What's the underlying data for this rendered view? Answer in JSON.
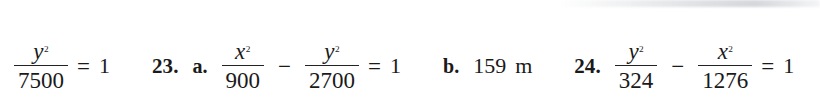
{
  "page": {
    "background_color": "#ffffff",
    "ink_color": "#1a1a1a"
  },
  "answers": [
    {
      "id": "answer-fragment-tail",
      "number": "",
      "parts": [
        {
          "kind": "fraction",
          "numerator_base": "y",
          "numerator_exponent": "2",
          "denominator": "7500"
        },
        {
          "kind": "operator",
          "text": "="
        },
        {
          "kind": "number",
          "text": "1"
        }
      ]
    },
    {
      "id": "answer-23",
      "number": "23.",
      "part_a_label": "a.",
      "part_b_label": "b.",
      "part_a": [
        {
          "kind": "fraction",
          "numerator_base": "x",
          "numerator_exponent": "2",
          "denominator": "900"
        },
        {
          "kind": "operator",
          "text": "−"
        },
        {
          "kind": "fraction",
          "numerator_base": "y",
          "numerator_exponent": "2",
          "denominator": "2700"
        },
        {
          "kind": "operator",
          "text": "="
        },
        {
          "kind": "number",
          "text": "1"
        }
      ],
      "part_b": {
        "value": "159",
        "unit": "m"
      }
    },
    {
      "id": "answer-24",
      "number": "24.",
      "parts": [
        {
          "kind": "fraction",
          "numerator_base": "y",
          "numerator_exponent": "2",
          "denominator": "324"
        },
        {
          "kind": "operator",
          "text": "−"
        },
        {
          "kind": "fraction",
          "numerator_base": "x",
          "numerator_exponent": "2",
          "denominator": "1276"
        },
        {
          "kind": "operator",
          "text": "="
        },
        {
          "kind": "number",
          "text": "1"
        }
      ]
    }
  ],
  "tokens": {
    "frac0_num_base": "y",
    "frac0_num_exp": "2",
    "frac0_den": "7500",
    "eq0": "=",
    "one0": "1",
    "num23": "23.",
    "label_a": "a.",
    "frac1_num_base": "x",
    "frac1_num_exp": "2",
    "frac1_den": "900",
    "minus1": "−",
    "frac2_num_base": "y",
    "frac2_num_exp": "2",
    "frac2_den": "2700",
    "eq1": "=",
    "one1": "1",
    "label_b": "b.",
    "b_value": "159",
    "b_unit": "m",
    "num24": "24.",
    "frac3_num_base": "y",
    "frac3_num_exp": "2",
    "frac3_den": "324",
    "minus2": "−",
    "frac4_num_base": "x",
    "frac4_num_exp": "2",
    "frac4_den": "1276",
    "eq2": "=",
    "one2": "1"
  }
}
